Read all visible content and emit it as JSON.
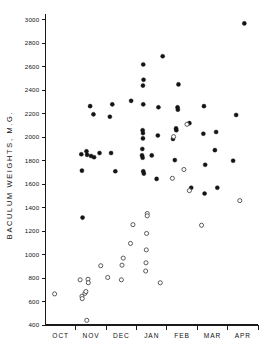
{
  "chart_data": {
    "type": "scatter",
    "title": "",
    "xlabel": "",
    "ylabel": "BACULUM  WEIGHTS,  M.G.",
    "categories": [
      "OCT",
      "NOV",
      "DEC",
      "JAN",
      "FEB",
      "MAR",
      "APR"
    ],
    "ylim": [
      400,
      3050
    ],
    "yticks": [
      400,
      600,
      800,
      1000,
      1200,
      1400,
      1600,
      1800,
      2000,
      2200,
      2400,
      2600,
      2800,
      3000
    ],
    "ytick_labels": [
      "400",
      "600",
      "800",
      "1000",
      "1200",
      "1400",
      "1600",
      "1800",
      "2000",
      "2200",
      "2400",
      "2600",
      "2800",
      "3000"
    ],
    "grid": false,
    "legend_position": "none",
    "series": [
      {
        "name": "filled-circles",
        "marker": "filled-circle",
        "color": "#141414",
        "points": [
          {
            "month": "NOV",
            "offset": 0.18,
            "value": 1855
          },
          {
            "month": "NOV",
            "offset": 0.35,
            "value": 1880
          },
          {
            "month": "NOV",
            "offset": 0.37,
            "value": 1850
          },
          {
            "month": "NOV",
            "offset": 0.47,
            "value": 2265
          },
          {
            "month": "NOV",
            "offset": 0.58,
            "value": 2195
          },
          {
            "month": "NOV",
            "offset": 0.5,
            "value": 1840
          },
          {
            "month": "NOV",
            "offset": 0.6,
            "value": 1830
          },
          {
            "month": "NOV",
            "offset": 0.78,
            "value": 1865
          },
          {
            "month": "NOV",
            "offset": 0.2,
            "value": 1715
          },
          {
            "month": "NOV",
            "offset": 0.22,
            "value": 1315
          },
          {
            "month": "DEC",
            "offset": 0.2,
            "value": 2280
          },
          {
            "month": "DEC",
            "offset": 0.12,
            "value": 2175
          },
          {
            "month": "DEC",
            "offset": 0.16,
            "value": 1865
          },
          {
            "month": "DEC",
            "offset": 0.3,
            "value": 1710
          },
          {
            "month": "DEC",
            "offset": 0.82,
            "value": 2310
          },
          {
            "month": "JAN",
            "offset": 0.22,
            "value": 2620
          },
          {
            "month": "JAN",
            "offset": 0.23,
            "value": 2490
          },
          {
            "month": "JAN",
            "offset": 0.21,
            "value": 2440
          },
          {
            "month": "JAN",
            "offset": 0.22,
            "value": 2280
          },
          {
            "month": "JAN",
            "offset": 0.2,
            "value": 2060
          },
          {
            "month": "JAN",
            "offset": 0.21,
            "value": 2035
          },
          {
            "month": "JAN",
            "offset": 0.21,
            "value": 1990
          },
          {
            "month": "JAN",
            "offset": 0.19,
            "value": 1900
          },
          {
            "month": "JAN",
            "offset": 0.18,
            "value": 1845
          },
          {
            "month": "JAN",
            "offset": 0.2,
            "value": 1825
          },
          {
            "month": "JAN",
            "offset": 0.22,
            "value": 1710
          },
          {
            "month": "JAN",
            "offset": 0.24,
            "value": 1690
          },
          {
            "month": "JAN",
            "offset": 0.5,
            "value": 1845
          },
          {
            "month": "JAN",
            "offset": 0.72,
            "value": 2255
          },
          {
            "month": "JAN",
            "offset": 0.7,
            "value": 2015
          },
          {
            "month": "JAN",
            "offset": 0.66,
            "value": 1645
          },
          {
            "month": "JAN",
            "offset": 0.86,
            "value": 2690
          },
          {
            "month": "FEB",
            "offset": 0.38,
            "value": 2450
          },
          {
            "month": "FEB",
            "offset": 0.35,
            "value": 2255
          },
          {
            "month": "FEB",
            "offset": 0.36,
            "value": 2235
          },
          {
            "month": "FEB",
            "offset": 0.3,
            "value": 2075
          },
          {
            "month": "FEB",
            "offset": 0.31,
            "value": 2060
          },
          {
            "month": "FEB",
            "offset": 0.26,
            "value": 1805
          },
          {
            "month": "FEB",
            "offset": 0.2,
            "value": 1985
          },
          {
            "month": "FEB",
            "offset": 0.74,
            "value": 2120
          },
          {
            "month": "FEB",
            "offset": 0.8,
            "value": 1570
          },
          {
            "month": "MAR",
            "offset": 0.22,
            "value": 2265
          },
          {
            "month": "MAR",
            "offset": 0.2,
            "value": 2030
          },
          {
            "month": "MAR",
            "offset": 0.26,
            "value": 1765
          },
          {
            "month": "MAR",
            "offset": 0.24,
            "value": 1520
          },
          {
            "month": "MAR",
            "offset": 0.62,
            "value": 2045
          },
          {
            "month": "MAR",
            "offset": 0.58,
            "value": 1890
          },
          {
            "month": "MAR",
            "offset": 0.66,
            "value": 1570
          },
          {
            "month": "APR",
            "offset": 0.28,
            "value": 2190
          },
          {
            "month": "APR",
            "offset": 0.18,
            "value": 1800
          },
          {
            "month": "APR",
            "offset": 0.55,
            "value": 2970
          }
        ]
      },
      {
        "name": "open-circles",
        "marker": "open-circle",
        "color": "#4a4a4a",
        "points": [
          {
            "month": "OCT",
            "offset": 0.3,
            "value": 665
          },
          {
            "month": "NOV",
            "offset": 0.14,
            "value": 785
          },
          {
            "month": "NOV",
            "offset": 0.2,
            "value": 645
          },
          {
            "month": "NOV",
            "offset": 0.21,
            "value": 625
          },
          {
            "month": "NOV",
            "offset": 0.3,
            "value": 670
          },
          {
            "month": "NOV",
            "offset": 0.33,
            "value": 685
          },
          {
            "month": "NOV",
            "offset": 0.4,
            "value": 790
          },
          {
            "month": "NOV",
            "offset": 0.41,
            "value": 760
          },
          {
            "month": "NOV",
            "offset": 0.36,
            "value": 440
          },
          {
            "month": "NOV",
            "offset": 0.82,
            "value": 905
          },
          {
            "month": "DEC",
            "offset": 0.05,
            "value": 805
          },
          {
            "month": "DEC",
            "offset": 0.56,
            "value": 970
          },
          {
            "month": "DEC",
            "offset": 0.52,
            "value": 910
          },
          {
            "month": "DEC",
            "offset": 0.5,
            "value": 785
          },
          {
            "month": "DEC",
            "offset": 0.8,
            "value": 1095
          },
          {
            "month": "DEC",
            "offset": 0.88,
            "value": 1255
          },
          {
            "month": "JAN",
            "offset": 0.35,
            "value": 1350
          },
          {
            "month": "JAN",
            "offset": 0.35,
            "value": 1330
          },
          {
            "month": "JAN",
            "offset": 0.33,
            "value": 1180
          },
          {
            "month": "JAN",
            "offset": 0.32,
            "value": 1040
          },
          {
            "month": "JAN",
            "offset": 0.31,
            "value": 930
          },
          {
            "month": "JAN",
            "offset": 0.3,
            "value": 860
          },
          {
            "month": "JAN",
            "offset": 0.78,
            "value": 760
          },
          {
            "month": "FEB",
            "offset": 0.22,
            "value": 2005
          },
          {
            "month": "FEB",
            "offset": 0.18,
            "value": 1650
          },
          {
            "month": "FEB",
            "offset": 0.66,
            "value": 2110
          },
          {
            "month": "FEB",
            "offset": 0.56,
            "value": 1725
          },
          {
            "month": "FEB",
            "offset": 0.74,
            "value": 1545
          },
          {
            "month": "MAR",
            "offset": 0.14,
            "value": 1250
          },
          {
            "month": "APR",
            "offset": 0.4,
            "value": 1460
          }
        ]
      }
    ]
  },
  "axes": {
    "y_axis_name": "baculum-weights-axis",
    "x_axis_name": "month-axis"
  }
}
